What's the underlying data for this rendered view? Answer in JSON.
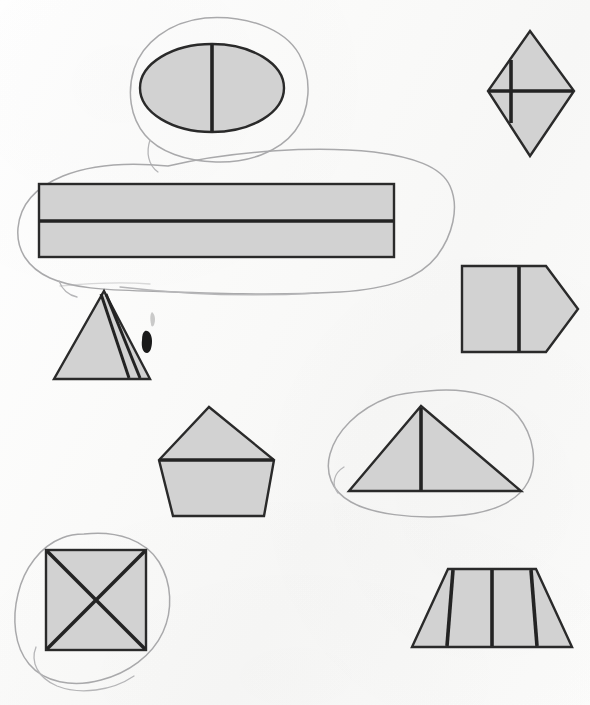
{
  "page": {
    "title": "Partitioned Shapes Worksheet",
    "medium": "scanned paper",
    "width": 590,
    "height": 705,
    "background_color": "#fbfbfa"
  },
  "palette": {
    "shape_fill": "#d2d2d2",
    "shape_outline": "#2a2a2a",
    "divider_line": "#232323",
    "annotation_loop": "#a9a9ab",
    "ink_blot": "#1a1a1a"
  },
  "shapes": [
    {
      "id": "ellipse-halved",
      "label": "ellipse",
      "parts": 2,
      "divider": "one vertical line",
      "circled": true,
      "position": "top center"
    },
    {
      "id": "rhombus-quartered",
      "label": "rhombus",
      "parts": 4,
      "divider": "vertical and horizontal cross",
      "circled": false,
      "position": "top right"
    },
    {
      "id": "rectangle-halved",
      "label": "rectangle",
      "parts": 2,
      "divider": "one horizontal line",
      "circled": true,
      "position": "upper left band"
    },
    {
      "id": "triangle-striped",
      "label": "triangle",
      "parts": 3,
      "divider": "two slanted parallel lines",
      "circled": false,
      "position": "middle left"
    },
    {
      "id": "pentagon-arrow-halved",
      "label": "pentagon",
      "parts": 2,
      "divider": "one vertical line",
      "circled": false,
      "position": "middle right"
    },
    {
      "id": "pentagon-house-halved",
      "label": "pentagon",
      "parts": 2,
      "divider": "one horizontal line",
      "circled": false,
      "position": "center"
    },
    {
      "id": "triangle-halved",
      "label": "triangle",
      "parts": 2,
      "divider": "one vertical line",
      "circled": true,
      "position": "center right"
    },
    {
      "id": "square-quartered",
      "label": "square",
      "parts": 4,
      "divider": "two diagonals forming an X",
      "circled": true,
      "position": "bottom left"
    },
    {
      "id": "trapezoid-fourths",
      "label": "trapezoid",
      "parts": 4,
      "divider": "three vertical lines",
      "circled": false,
      "position": "bottom right"
    }
  ],
  "annotations": [
    {
      "id": "loop-ellipse",
      "target": "ellipse-halved",
      "kind": "hand-drawn circle"
    },
    {
      "id": "loop-rectangle",
      "target": "rectangle-halved",
      "kind": "hand-drawn circle"
    },
    {
      "id": "loop-triangle-halved",
      "target": "triangle-halved",
      "kind": "hand-drawn circle"
    },
    {
      "id": "loop-square",
      "target": "square-quartered",
      "kind": "hand-drawn circle"
    }
  ],
  "artifacts": [
    {
      "id": "ink-blot",
      "kind": "ink blot",
      "x": 148,
      "y": 340
    },
    {
      "id": "pencil-smudge",
      "kind": "faint pencil smudge",
      "x": 155,
      "y": 318
    }
  ],
  "summary": {
    "shape_count": "9 shapes",
    "circled_count": "4 circled"
  }
}
